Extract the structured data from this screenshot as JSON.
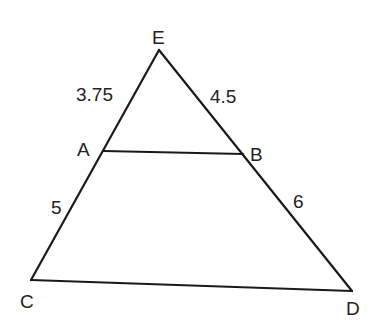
{
  "points": {
    "E": {
      "label": "E",
      "x": 159,
      "y": 50
    },
    "A": {
      "label": "A",
      "x": 104,
      "y": 151
    },
    "B": {
      "label": "B",
      "x": 243,
      "y": 154
    },
    "C": {
      "label": "C",
      "x": 31,
      "y": 280
    },
    "D": {
      "label": "D",
      "x": 352,
      "y": 291
    }
  },
  "segments": {
    "EA": "3.75",
    "EB": "4.5",
    "AC": "5",
    "BD": "6"
  },
  "colors": {
    "stroke": "#1a1a1a",
    "text": "#222222",
    "background": "#ffffff"
  }
}
